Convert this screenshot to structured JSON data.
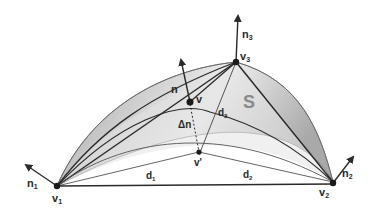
{
  "figure": {
    "type": "diagram",
    "colors": {
      "background": "#ffffff",
      "surface_fill_dark": "#a8a8a8",
      "surface_fill_light": "#e6e6e6",
      "line": "#2a2a2a",
      "thin_line": "#555555",
      "label": "#2a2a2a",
      "surface_label": "#8a8a8a"
    },
    "labels": {
      "v1": "v",
      "v1_sub": "1",
      "v2": "v",
      "v2_sub": "2",
      "v3": "v",
      "v3_sub": "3",
      "n1": "n",
      "n1_sub": "1",
      "n2": "n",
      "n2_sub": "2",
      "n3": "n",
      "n3_sub": "3",
      "n": "n",
      "v": "v",
      "v_prime": "v'",
      "delta_n": "Δn",
      "d1": "d",
      "d1_sub": "1",
      "d2": "d",
      "d2_sub": "2",
      "d3": "d",
      "d3_sub": "3",
      "surface": "S"
    }
  }
}
